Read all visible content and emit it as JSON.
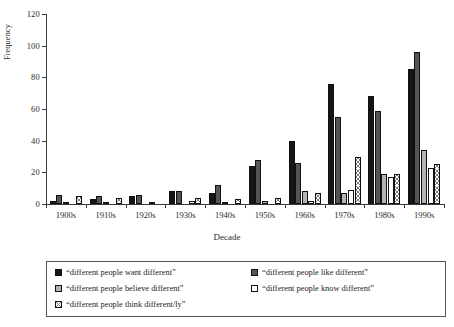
{
  "chart_data": {
    "type": "bar",
    "title": "",
    "xlabel": "Decade",
    "ylabel": "Frequency",
    "ylim": [
      0,
      120
    ],
    "yticks": [
      0,
      20,
      40,
      60,
      80,
      100,
      120
    ],
    "grid": false,
    "legend_position": "bottom",
    "categories": [
      "1900s",
      "1910s",
      "1920s",
      "1930s",
      "1940s",
      "1950s",
      "1960s",
      "1970s",
      "1980s",
      "1990s"
    ],
    "series": [
      {
        "name": "“different people want different”",
        "color": "#151515",
        "pattern": "solid-black",
        "values": [
          2,
          3,
          5,
          8,
          7,
          24,
          40,
          76,
          68,
          85
        ]
      },
      {
        "name": "“different people like different”",
        "color": "#555555",
        "pattern": "solid-dark-gray",
        "values": [
          6,
          5,
          6,
          8,
          12,
          28,
          26,
          55,
          59,
          96
        ]
      },
      {
        "name": "“different people believe different”",
        "color": "#b4b4b4",
        "pattern": "solid-light-gray",
        "values": [
          1,
          1,
          0,
          0,
          1,
          2,
          8,
          7,
          19,
          34
        ]
      },
      {
        "name": "“different people know different”",
        "color": "#ffffff",
        "pattern": "white",
        "values": [
          0,
          0,
          1,
          2,
          0,
          0,
          2,
          9,
          17,
          23
        ]
      },
      {
        "name": "“different people think different/ly”",
        "color": "#ffffff",
        "pattern": "crosshatch",
        "values": [
          5,
          4,
          0,
          4,
          3,
          4,
          7,
          30,
          19,
          25
        ]
      }
    ]
  }
}
